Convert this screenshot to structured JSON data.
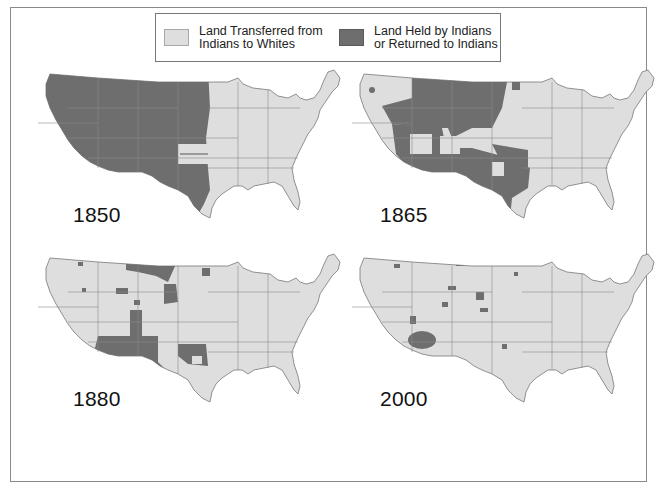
{
  "legend": {
    "items": [
      {
        "label_line1": "Land Transferred from",
        "label_line2": "Indians to Whites",
        "color": "#dedede"
      },
      {
        "label_line1": "Land Held by Indians",
        "label_line2": "or Returned to Indians",
        "color": "#6e6e6e"
      }
    ]
  },
  "maps": [
    {
      "year": "1850",
      "position": "top-left"
    },
    {
      "year": "1865",
      "position": "top-right"
    },
    {
      "year": "1880",
      "position": "bottom-left"
    },
    {
      "year": "2000",
      "position": "bottom-right"
    }
  ],
  "colors": {
    "transferred": "#dedede",
    "held": "#6e6e6e",
    "state_lines": "#8a8a8a",
    "frame": "#8a8a8a"
  }
}
